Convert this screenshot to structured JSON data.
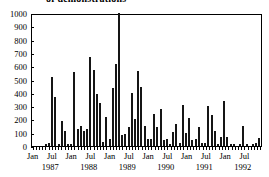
{
  "chart_data": {
    "type": "bar",
    "title": "of demonstrations",
    "title_clipped": true,
    "xlabel": "",
    "ylabel": "",
    "ylim": [
      0,
      1000
    ],
    "ytick_labels": [
      "0",
      "100",
      "200",
      "300",
      "400",
      "500",
      "600",
      "700",
      "800",
      "900",
      "1000"
    ],
    "ytick_values": [
      0,
      100,
      200,
      300,
      400,
      500,
      600,
      700,
      800,
      900,
      1000
    ],
    "grid": false,
    "legend": false,
    "x_tick_labels": [
      "Jan",
      "Jul",
      "Jan",
      "Jul",
      "Jan",
      "Jul",
      "Jan",
      "Jul",
      "Jan",
      "Jul",
      "Jan",
      "Jul"
    ],
    "year_labels": [
      "1987",
      "1988",
      "1989",
      "1990",
      "1991",
      "1992"
    ],
    "note": "Monthly counts Jan 1987 - Dec 1992; one bar exceeds the 1000 axis maximum and is clipped.",
    "categories": [
      "Jan 1987",
      "Feb 1987",
      "Mar 1987",
      "Apr 1987",
      "May 1987",
      "Jun 1987",
      "Jul 1987",
      "Aug 1987",
      "Sep 1987",
      "Oct 1987",
      "Nov 1987",
      "Dec 1987",
      "Jan 1988",
      "Feb 1988",
      "Mar 1988",
      "Apr 1988",
      "May 1988",
      "Jun 1988",
      "Jul 1988",
      "Aug 1988",
      "Sep 1988",
      "Oct 1988",
      "Nov 1988",
      "Dec 1988",
      "Jan 1989",
      "Feb 1989",
      "Mar 1989",
      "Apr 1989",
      "May 1989",
      "Jun 1989",
      "Jul 1989",
      "Aug 1989",
      "Sep 1989",
      "Oct 1989",
      "Nov 1989",
      "Dec 1989",
      "Jan 1990",
      "Feb 1990",
      "Mar 1990",
      "Apr 1990",
      "May 1990",
      "Jun 1990",
      "Jul 1990",
      "Aug 1990",
      "Sep 1990",
      "Oct 1990",
      "Nov 1990",
      "Dec 1990",
      "Jan 1991",
      "Feb 1991",
      "Mar 1991",
      "Apr 1991",
      "May 1991",
      "Jun 1991",
      "Jul 1991",
      "Aug 1991",
      "Sep 1991",
      "Oct 1991",
      "Nov 1991",
      "Dec 1991",
      "Jan 1992",
      "Feb 1992",
      "Mar 1992",
      "Apr 1992",
      "May 1992",
      "Jun 1992",
      "Jul 1992",
      "Aug 1992",
      "Sep 1992",
      "Oct 1992",
      "Nov 1992",
      "Dec 1992"
    ],
    "values": [
      0,
      0,
      0,
      0,
      5,
      20,
      520,
      365,
      15,
      185,
      110,
      10,
      15,
      555,
      125,
      150,
      115,
      125,
      670,
      570,
      390,
      325,
      30,
      220,
      50,
      435,
      615,
      1080,
      85,
      90,
      145,
      400,
      200,
      565,
      440,
      150,
      50,
      55,
      240,
      140,
      280,
      45,
      50,
      10,
      105,
      165,
      20,
      310,
      100,
      210,
      45,
      50,
      140,
      20,
      25,
      300,
      230,
      115,
      10,
      70,
      335,
      70,
      10,
      5,
      0,
      5,
      150,
      10,
      0,
      5,
      20,
      60
    ],
    "colors": {
      "bar_fill": "#ffffff",
      "bar_edge": "#151515",
      "axis": "#000000",
      "background": "#ffffff"
    }
  }
}
